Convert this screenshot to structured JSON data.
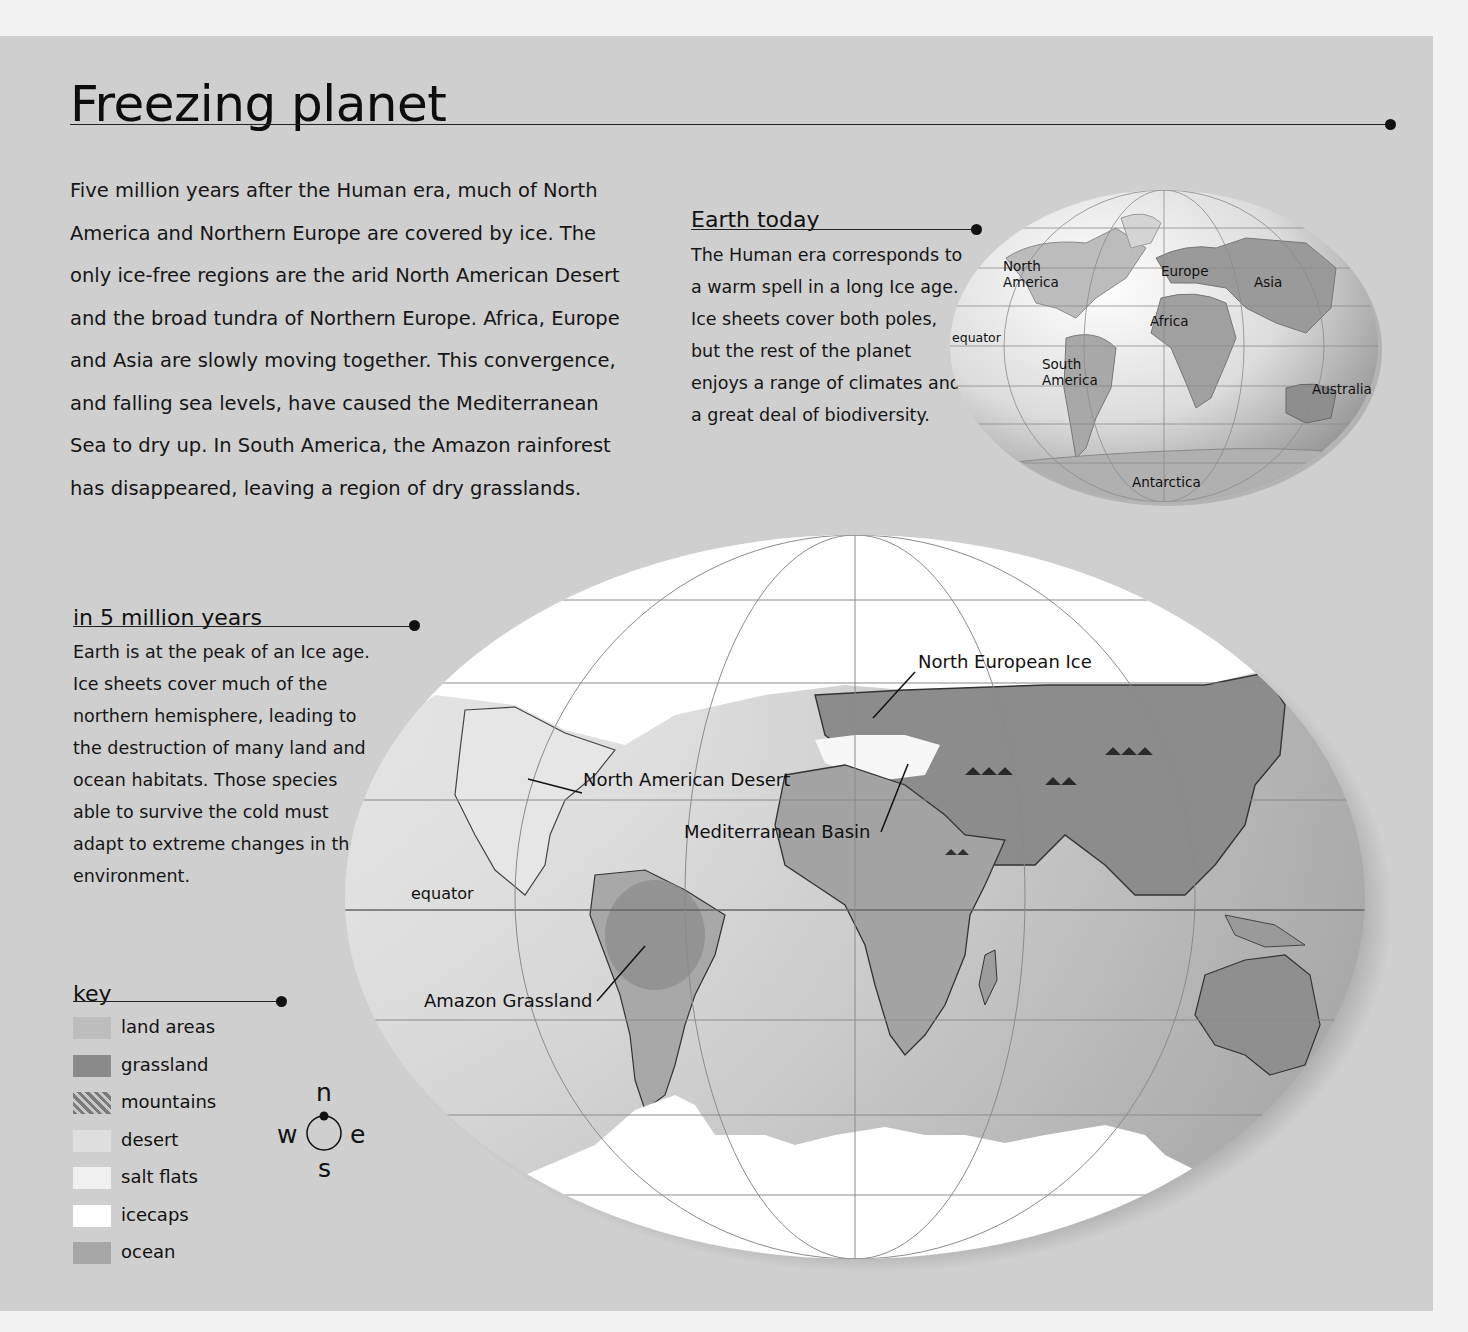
{
  "page": {
    "title": "Freezing planet",
    "intro": "Five million years after the Human era, much of North America and Northern Europe are covered by ice. The only ice-free regions are the arid North American Desert and the broad tundra of Northern Europe. Africa, Europe and Asia are slowly moving together. This convergence, and falling sea levels, have caused the Mediterranean Sea to dry up. In South America, the Amazon rainforest has disappeared, leaving a region of dry grasslands."
  },
  "earth_today": {
    "heading": "Earth today",
    "body": "The Human era corresponds to a warm spell in a long Ice age. Ice sheets cover both poles, but the rest of the planet enjoys a range of climates and a great deal of biodiversity.",
    "map_labels": {
      "north_america": "North America",
      "europe": "Europe",
      "asia": "Asia",
      "africa": "Africa",
      "equator": "equator",
      "south_america": "South America",
      "australia": "Australia",
      "antarctica": "Antarctica"
    }
  },
  "future": {
    "heading": "in 5 million years",
    "body": "Earth is at the peak of an Ice age. Ice sheets cover much of the northern hemisphere, leading to the destruction of many land and ocean habitats. Those species able to survive the cold must adapt to extreme changes in their environment.",
    "map_labels": {
      "north_european_ice": "North European Ice",
      "north_american_desert": "North American Desert",
      "mediterranean_basin": "Mediterranean Basin",
      "equator": "equator",
      "amazon_grassland": "Amazon Grassland"
    }
  },
  "key": {
    "heading": "key",
    "items": [
      {
        "label": "land areas",
        "color": "#bdbdbd"
      },
      {
        "label": "grassland",
        "color": "#8a8a8a"
      },
      {
        "label": "mountains",
        "color": "#9a9a9a"
      },
      {
        "label": "desert",
        "color": "#dedede"
      },
      {
        "label": "salt flats",
        "color": "#f0f0f0"
      },
      {
        "label": "icecaps",
        "color": "#ffffff"
      },
      {
        "label": "ocean",
        "color": "#a6a6a6"
      }
    ]
  },
  "compass": {
    "n": "n",
    "s": "s",
    "e": "e",
    "w": "w"
  }
}
